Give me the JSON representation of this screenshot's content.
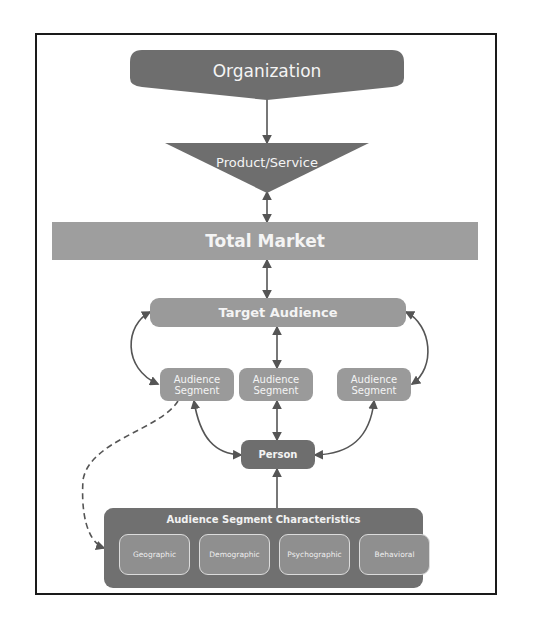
{
  "diagram": {
    "organization": "Organization",
    "product_service": "Product/Service",
    "total_market": "Total Market",
    "target_audience": "Target Audience",
    "segments": [
      {
        "line1": "Audience",
        "line2": "Segment"
      },
      {
        "line1": "Audience",
        "line2": "Segment"
      },
      {
        "line1": "Audience",
        "line2": "Segment"
      }
    ],
    "person": "Person",
    "characteristics": {
      "title": "Audience Segment Characteristics",
      "items": [
        "Geographic",
        "Demographic",
        "Psychographic",
        "Behavioral"
      ]
    }
  },
  "colors": {
    "dark": "#6e6e6e",
    "medium": "#9a9a9a",
    "frame": "#1a1a1a",
    "connector": "#555555"
  }
}
